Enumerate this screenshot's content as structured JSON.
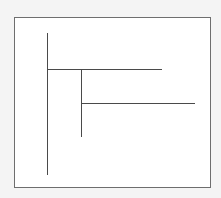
{
  "diagram": {
    "type": "tree-dendrogram",
    "colors": {
      "line": "#4a4a4a",
      "frame": "#6e6e6e",
      "background": "#ffffff",
      "page": "#f4f4f4"
    },
    "segments": [
      {
        "name": "root-vertical",
        "x1": 47,
        "y1": 33,
        "x2": 47,
        "y2": 175
      },
      {
        "name": "branch-1-horizontal",
        "x1": 47,
        "y1": 69,
        "x2": 162,
        "y2": 69
      },
      {
        "name": "sub-vertical",
        "x1": 81,
        "y1": 69,
        "x2": 81,
        "y2": 137
      },
      {
        "name": "branch-2-horizontal",
        "x1": 81,
        "y1": 103,
        "x2": 195,
        "y2": 103
      }
    ]
  }
}
